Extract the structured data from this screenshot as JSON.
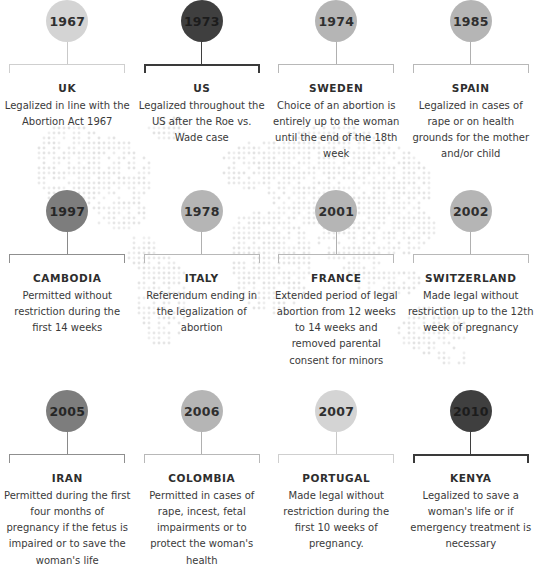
{
  "theme": {
    "background": "#ffffff",
    "map_dot_color": "#e2e2e2",
    "text_color": "#3a3a3a",
    "heading_color": "#2e2e2e",
    "shade_light": "#d4d4d4",
    "shade_mid": "#b5b5b5",
    "shade_dark": "#7d7d7d",
    "shade_black": "#3f3f3f"
  },
  "timeline": {
    "rows": [
      {
        "entries": [
          {
            "year": "1967",
            "country": "UK",
            "description": "Legalized in line with the Abortion Act 1967",
            "shade": "shade-light"
          },
          {
            "year": "1973",
            "country": "US",
            "description": "Legalized throughout the US after the Roe vs. Wade case",
            "shade": "shade-black"
          },
          {
            "year": "1974",
            "country": "SWEDEN",
            "description": "Choice of an abortion is entirely up to the woman until the end of the 18th week",
            "shade": "shade-mid"
          },
          {
            "year": "1985",
            "country": "SPAIN",
            "description": "Legalized in cases of rape or on health grounds for the mother and/or child",
            "shade": "shade-mid"
          }
        ]
      },
      {
        "entries": [
          {
            "year": "1997",
            "country": "CAMBODIA",
            "description": "Permitted without restriction during the first 14 weeks",
            "shade": "shade-dark"
          },
          {
            "year": "1978",
            "country": "ITALY",
            "description": "Referendum ending in the legalization of abortion",
            "shade": "shade-mid"
          },
          {
            "year": "2001",
            "country": "FRANCE",
            "description": "Extended period of legal abortion from 12 weeks to 14 weeks and removed parental consent for minors",
            "shade": "shade-mid"
          },
          {
            "year": "2002",
            "country": "SWITZERLAND",
            "description": "Made legal without restriction up to the 12th week of pregnancy",
            "shade": "shade-mid"
          }
        ]
      },
      {
        "entries": [
          {
            "year": "2005",
            "country": "IRAN",
            "description": "Permitted during the first four months of pregnancy if the fetus is impaired or to save the woman's life",
            "shade": "shade-dark"
          },
          {
            "year": "2006",
            "country": "COLOMBIA",
            "description": "Permitted in cases of rape, incest, fetal impairments or to protect the woman's health",
            "shade": "shade-mid"
          },
          {
            "year": "2007",
            "country": "PORTUGAL",
            "description": "Made legal without restriction during the first 10 weeks of pregnancy.",
            "shade": "shade-light"
          },
          {
            "year": "2010",
            "country": "KENYA",
            "description": "Legalized to save a woman's life or if emergency treatment is necessary",
            "shade": "shade-black"
          }
        ]
      }
    ]
  }
}
